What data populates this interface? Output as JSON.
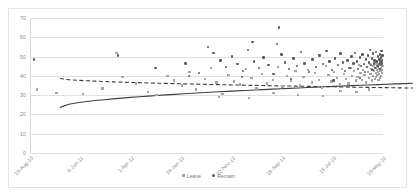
{
  "chart_data": {
    "type": "scatter",
    "title": "",
    "xlabel": "",
    "ylabel": "",
    "ylim": [
      0,
      70
    ],
    "yticks": [
      0,
      10,
      20,
      30,
      40,
      50,
      60,
      70
    ],
    "grid": true,
    "legend_position": "bottom",
    "xticklabels": [
      "10-Aug-10",
      "6-Jun-11",
      "1-Apr-12",
      "24-Jan-13",
      "22-Nov-13",
      "18-Sep-14",
      "15-Jul-15",
      "10-May-16"
    ],
    "xtick_positions": [
      0.0,
      0.143,
      0.286,
      0.429,
      0.571,
      0.714,
      0.857,
      1.0
    ],
    "series": [
      {
        "name": "Leave",
        "marker": "square",
        "color": "#a6a6a6",
        "trendline": {
          "style": "solid",
          "color": "#404040",
          "start_value": 33,
          "end_value": 45.5
        },
        "points": [
          [
            0.02,
            33.0
          ],
          [
            0.075,
            31.0
          ],
          [
            0.15,
            30.5
          ],
          [
            0.205,
            33.5
          ],
          [
            0.245,
            52.0
          ],
          [
            0.262,
            39.5
          ],
          [
            0.3,
            36.0
          ],
          [
            0.335,
            31.5
          ],
          [
            0.358,
            30.0
          ],
          [
            0.39,
            40.0
          ],
          [
            0.408,
            37.5
          ],
          [
            0.43,
            35.0
          ],
          [
            0.452,
            42.0
          ],
          [
            0.47,
            33.0
          ],
          [
            0.495,
            38.5
          ],
          [
            0.512,
            44.0
          ],
          [
            0.528,
            36.5
          ],
          [
            0.545,
            30.5
          ],
          [
            0.562,
            40.5
          ],
          [
            0.578,
            37.0
          ],
          [
            0.595,
            35.5
          ],
          [
            0.612,
            43.5
          ],
          [
            0.628,
            39.0
          ],
          [
            0.642,
            33.5
          ],
          [
            0.658,
            41.0
          ],
          [
            0.672,
            36.0
          ],
          [
            0.688,
            38.0
          ],
          [
            0.702,
            44.5
          ],
          [
            0.715,
            34.5
          ],
          [
            0.728,
            40.0
          ],
          [
            0.74,
            37.5
          ],
          [
            0.752,
            42.5
          ],
          [
            0.765,
            35.0
          ],
          [
            0.775,
            39.5
          ],
          [
            0.788,
            43.0
          ],
          [
            0.798,
            36.5
          ],
          [
            0.808,
            41.5
          ],
          [
            0.818,
            38.0
          ],
          [
            0.828,
            34.0
          ],
          [
            0.838,
            45.0
          ],
          [
            0.846,
            40.5
          ],
          [
            0.854,
            37.0
          ],
          [
            0.862,
            42.0
          ],
          [
            0.87,
            39.0
          ],
          [
            0.878,
            35.5
          ],
          [
            0.884,
            43.5
          ],
          [
            0.89,
            41.0
          ],
          [
            0.896,
            38.5
          ],
          [
            0.902,
            36.0
          ],
          [
            0.908,
            44.0
          ],
          [
            0.913,
            40.0
          ],
          [
            0.918,
            42.5
          ],
          [
            0.923,
            37.5
          ],
          [
            0.928,
            39.5
          ],
          [
            0.932,
            45.5
          ],
          [
            0.936,
            41.5
          ],
          [
            0.94,
            38.0
          ],
          [
            0.944,
            43.0
          ],
          [
            0.948,
            40.5
          ],
          [
            0.951,
            36.5
          ],
          [
            0.954,
            44.5
          ],
          [
            0.957,
            42.0
          ],
          [
            0.96,
            39.0
          ],
          [
            0.963,
            46.0
          ],
          [
            0.965,
            41.0
          ],
          [
            0.967,
            43.5
          ],
          [
            0.969,
            37.5
          ],
          [
            0.971,
            40.0
          ],
          [
            0.973,
            45.0
          ],
          [
            0.975,
            42.5
          ],
          [
            0.977,
            38.5
          ],
          [
            0.979,
            44.0
          ],
          [
            0.98,
            41.5
          ],
          [
            0.981,
            39.5
          ],
          [
            0.982,
            46.5
          ],
          [
            0.983,
            43.0
          ],
          [
            0.984,
            40.5
          ],
          [
            0.985,
            42.0
          ],
          [
            0.986,
            44.5
          ],
          [
            0.987,
            38.0
          ],
          [
            0.988,
            45.5
          ],
          [
            0.989,
            41.0
          ],
          [
            0.99,
            43.5
          ],
          [
            0.991,
            39.0
          ],
          [
            0.992,
            47.0
          ],
          [
            0.993,
            42.5
          ],
          [
            0.994,
            40.0
          ],
          [
            0.995,
            44.0
          ],
          [
            0.996,
            46.0
          ],
          [
            0.997,
            41.5
          ],
          [
            0.998,
            43.0
          ],
          [
            0.999,
            45.0
          ],
          [
            0.535,
            29.0
          ],
          [
            0.62,
            28.5
          ],
          [
            0.69,
            31.0
          ],
          [
            0.76,
            30.0
          ],
          [
            0.83,
            29.5
          ],
          [
            0.88,
            32.0
          ],
          [
            0.925,
            31.5
          ],
          [
            0.96,
            33.0
          ]
        ]
      },
      {
        "name": "Remain",
        "marker": "circle",
        "color": "#5a5a5a",
        "trendline": {
          "style": "dashed",
          "color": "#3a3a3a",
          "start_value": 48,
          "end_value": 43
        },
        "points": [
          [
            0.012,
            48.5
          ],
          [
            0.25,
            50.5
          ],
          [
            0.355,
            44.0
          ],
          [
            0.44,
            46.5
          ],
          [
            0.478,
            41.5
          ],
          [
            0.505,
            55.0
          ],
          [
            0.52,
            52.0
          ],
          [
            0.54,
            48.0
          ],
          [
            0.556,
            44.5
          ],
          [
            0.572,
            50.0
          ],
          [
            0.588,
            46.0
          ],
          [
            0.604,
            42.5
          ],
          [
            0.618,
            53.5
          ],
          [
            0.634,
            47.5
          ],
          [
            0.648,
            44.0
          ],
          [
            0.662,
            49.5
          ],
          [
            0.676,
            45.5
          ],
          [
            0.69,
            41.0
          ],
          [
            0.7,
            56.5
          ],
          [
            0.712,
            51.0
          ],
          [
            0.722,
            47.0
          ],
          [
            0.734,
            43.5
          ],
          [
            0.746,
            49.0
          ],
          [
            0.756,
            45.0
          ],
          [
            0.768,
            52.5
          ],
          [
            0.778,
            46.5
          ],
          [
            0.79,
            42.0
          ],
          [
            0.8,
            48.5
          ],
          [
            0.81,
            44.5
          ],
          [
            0.82,
            50.5
          ],
          [
            0.83,
            46.0
          ],
          [
            0.84,
            53.0
          ],
          [
            0.848,
            47.5
          ],
          [
            0.856,
            43.0
          ],
          [
            0.864,
            49.0
          ],
          [
            0.872,
            45.5
          ],
          [
            0.88,
            51.5
          ],
          [
            0.887,
            47.0
          ],
          [
            0.893,
            42.5
          ],
          [
            0.899,
            48.0
          ],
          [
            0.905,
            44.0
          ],
          [
            0.911,
            50.0
          ],
          [
            0.916,
            46.5
          ],
          [
            0.921,
            52.0
          ],
          [
            0.926,
            47.5
          ],
          [
            0.93,
            43.5
          ],
          [
            0.934,
            49.5
          ],
          [
            0.938,
            45.0
          ],
          [
            0.942,
            51.0
          ],
          [
            0.946,
            46.0
          ],
          [
            0.949,
            42.0
          ],
          [
            0.952,
            48.5
          ],
          [
            0.955,
            44.5
          ],
          [
            0.958,
            50.5
          ],
          [
            0.961,
            47.0
          ],
          [
            0.964,
            53.5
          ],
          [
            0.966,
            45.5
          ],
          [
            0.968,
            49.0
          ],
          [
            0.97,
            43.0
          ],
          [
            0.972,
            51.5
          ],
          [
            0.974,
            46.5
          ],
          [
            0.976,
            48.0
          ],
          [
            0.978,
            44.0
          ],
          [
            0.98,
            52.5
          ],
          [
            0.982,
            47.5
          ],
          [
            0.984,
            45.0
          ],
          [
            0.986,
            50.0
          ],
          [
            0.988,
            46.0
          ],
          [
            0.99,
            48.5
          ],
          [
            0.991,
            43.5
          ],
          [
            0.992,
            51.0
          ],
          [
            0.993,
            47.0
          ],
          [
            0.994,
            49.5
          ],
          [
            0.995,
            45.5
          ],
          [
            0.996,
            53.0
          ],
          [
            0.997,
            48.0
          ],
          [
            0.998,
            46.5
          ],
          [
            0.999,
            50.5
          ],
          [
            0.705,
            65.0
          ],
          [
            0.63,
            57.5
          ],
          [
            0.45,
            40.0
          ],
          [
            0.6,
            39.5
          ],
          [
            0.74,
            38.5
          ],
          [
            0.86,
            37.5
          ],
          [
            0.935,
            39.0
          ]
        ]
      }
    ]
  }
}
